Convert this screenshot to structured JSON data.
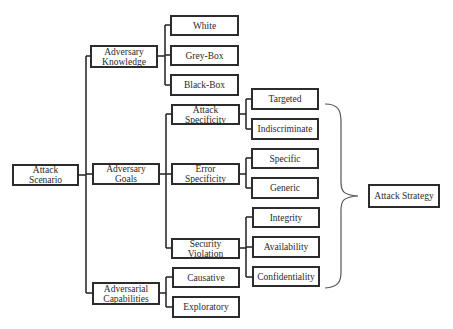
{
  "root": {
    "label": "Attack Scenario"
  },
  "categories": [
    {
      "label": "Adversary Knowledge",
      "children": [
        "White",
        "Grey-Box",
        "Black-Box"
      ]
    },
    {
      "label": "Adversary Goals",
      "children": [
        {
          "label": "Attack Specificity",
          "children": [
            "Targeted",
            "Indiscriminate"
          ]
        },
        {
          "label": "Error Specificity",
          "children": [
            "Specific",
            "Generic"
          ]
        },
        {
          "label": "Security Violation",
          "children": [
            "Integrity",
            "Availability",
            "Confidentiality"
          ]
        }
      ]
    },
    {
      "label": "Adversarial Capabilities",
      "children": [
        "Causative",
        "Exploratory"
      ]
    }
  ],
  "outcome": {
    "label": "Attack Strategy"
  },
  "labels": {
    "attack_scenario": "Attack Scenario",
    "adversary_knowledge": "Adversary Knowledge",
    "adversary_goals": "Adversary Goals",
    "adversarial_capabilities": "Adversarial Capabilities",
    "white": "White",
    "grey_box": "Grey-Box",
    "black_box": "Black-Box",
    "attack_specificity": "Attack Specificity",
    "error_specificity": "Error Specificity",
    "security_violation": "Security Violation",
    "causative": "Causative",
    "exploratory": "Exploratory",
    "targeted": "Targeted",
    "indiscriminate": "Indiscriminate",
    "specific": "Specific",
    "generic": "Generic",
    "integrity": "Integrity",
    "availability": "Availability",
    "confidentiality": "Confidentiality",
    "attack_strategy": "Attack Strategy"
  },
  "colors": {
    "line": "#2c2c2c",
    "brace": "#555555",
    "background": "#ffffff"
  }
}
